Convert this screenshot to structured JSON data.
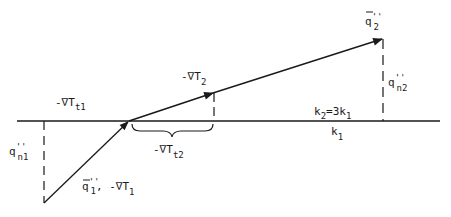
{
  "diagram": {
    "colors": {
      "ink": "#1a1a1a",
      "background": "#ffffff"
    },
    "interface": {
      "upper_label": "k2=3k1",
      "lower_label": "k1"
    },
    "labels": {
      "grad_t1": {
        "prefix": "-∇T",
        "sub": "t1"
      },
      "grad_2": {
        "prefix": "-∇T",
        "sub": "2"
      },
      "grad_t2": {
        "prefix": "-∇T",
        "sub": "t2"
      },
      "q2": {
        "base": "q",
        "prime": "''",
        "sub": "2"
      },
      "qn2": {
        "base": "q",
        "prime": "''",
        "sub": "n2"
      },
      "qn1": {
        "base": "q",
        "prime": "''",
        "sub": "n1"
      },
      "q1": {
        "base": "q",
        "prime": "''",
        "sub": "1",
        "suffix": ", -∇T",
        "suffix_sub": "1"
      },
      "k2_eq": {
        "a": "k",
        "a_sub": "2",
        "mid": "=3k",
        "b_sub": "1"
      },
      "k1": {
        "base": "k",
        "sub": "1"
      }
    }
  }
}
